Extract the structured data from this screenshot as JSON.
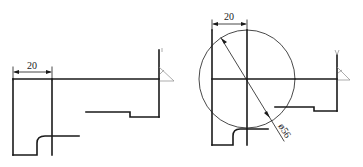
{
  "diagram": {
    "type": "engineering-drawing",
    "views": [
      {
        "id": "left-view",
        "description": "Stepped profile with reference line and dimension",
        "dimensions": [
          {
            "kind": "linear",
            "label": "20"
          }
        ],
        "surface_symbol": {
          "kind": "roughness-triangle"
        }
      },
      {
        "id": "right-view",
        "description": "Stepped profile overlaid with circle and diameter dimension",
        "dimensions": [
          {
            "kind": "linear",
            "label": "20"
          },
          {
            "kind": "diameter",
            "label": "ø56"
          }
        ],
        "surface_symbol": {
          "kind": "roughness-triangle"
        }
      }
    ],
    "colors": {
      "line": "#1a1a1a",
      "background": "#ffffff",
      "faint": "#8a8a8a"
    }
  }
}
